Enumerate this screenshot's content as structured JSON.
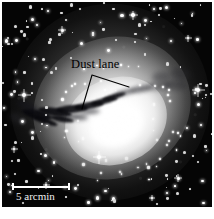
{
  "figure": {
    "kind": "astronomical-image",
    "background_color": "#ffffff",
    "plate_color": "#050505"
  },
  "annotation": {
    "label": "Dust lane",
    "label_color": "#000000",
    "leader": {
      "apex": {
        "x": 92,
        "y": 75
      },
      "left_end": {
        "x": 82,
        "y": 109
      },
      "right_end": {
        "x": 129,
        "y": 87
      },
      "color": "#000000",
      "width": 1.1
    }
  },
  "scalebar": {
    "label": "5 arcmin",
    "length_px": 58,
    "color": "#ffffff"
  },
  "stars": {
    "bright": [
      {
        "x": 22,
        "y": 93,
        "r": 2.0,
        "spike": 13
      },
      {
        "x": 196,
        "y": 88,
        "r": 2.1,
        "spike": 13
      },
      {
        "x": 97,
        "y": 155,
        "r": 2.1,
        "spike": 13
      },
      {
        "x": 131,
        "y": 13,
        "r": 1.7,
        "spike": 9
      },
      {
        "x": 60,
        "y": 28,
        "r": 1.5,
        "spike": 8
      },
      {
        "x": 176,
        "y": 176,
        "r": 1.5,
        "spike": 8
      },
      {
        "x": 44,
        "y": 183,
        "r": 1.4,
        "spike": 7
      },
      {
        "x": 186,
        "y": 36,
        "r": 1.3,
        "spike": 7
      },
      {
        "x": 12,
        "y": 147,
        "r": 1.3,
        "spike": 7
      },
      {
        "x": 150,
        "y": 196,
        "r": 1.3,
        "spike": 6
      }
    ],
    "field_count": 210
  }
}
